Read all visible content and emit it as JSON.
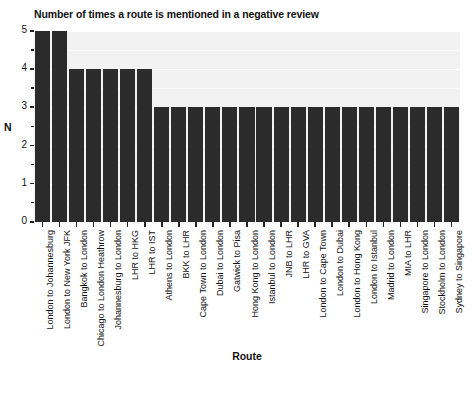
{
  "chart_data": {
    "type": "bar",
    "title": "Number of times a route is mentioned in a negative review",
    "xlabel": "Route",
    "ylabel": "N",
    "ylim": [
      0,
      5
    ],
    "yticks": [
      0,
      1,
      2,
      3,
      4,
      5
    ],
    "ytick_labels": [
      "0",
      "1",
      "2",
      "3",
      "4",
      "5"
    ],
    "minor_yticks": [
      0.5,
      1.5,
      2.5,
      3.5,
      4.5
    ],
    "grid": true,
    "legend": null,
    "bar_color": "#2b2b2b",
    "plot_background": "#f2f2f2",
    "categories": [
      "London to Johannesburg",
      "London to New York JFK",
      "Bangkok to London",
      "Chicago to London Heathrow",
      "Johannesburg to London",
      "LHR to HKG",
      "LHR to IST",
      "Athens to London",
      "BKK to LHR",
      "Cape Town to London",
      "Dubai to London",
      "Gatwick to Pisa",
      "Hong Kong to London",
      "Istanbul to London",
      "JNB to LHR",
      "LHR to GVA",
      "London to Cape Town",
      "London to Dubai",
      "London to Hong Kong",
      "London to Istanbul",
      "Madrid to London",
      "MIA to LHR",
      "Singapore to London",
      "Stockholm to London",
      "Sydney to Singapore"
    ],
    "values": [
      5,
      5,
      4,
      4,
      4,
      4,
      4,
      3,
      3,
      3,
      3,
      3,
      3,
      3,
      3,
      3,
      3,
      3,
      3,
      3,
      3,
      3,
      3,
      3,
      3
    ]
  }
}
